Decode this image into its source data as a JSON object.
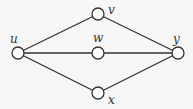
{
  "diagram": {
    "type": "graph",
    "colors": {
      "stroke": "#333333",
      "node_fill": "#ffffff",
      "background": "#f7f7f7"
    },
    "node_radius": 6,
    "nodes": [
      {
        "id": "u",
        "label": "u",
        "x": 18,
        "y": 53,
        "label_x": 10,
        "label_y": 43
      },
      {
        "id": "v",
        "label": "v",
        "x": 98,
        "y": 14,
        "label_x": 108,
        "label_y": 14
      },
      {
        "id": "w",
        "label": "w",
        "x": 98,
        "y": 53,
        "label_x": 93,
        "label_y": 42
      },
      {
        "id": "x",
        "label": "x",
        "x": 98,
        "y": 93,
        "label_x": 108,
        "label_y": 104
      },
      {
        "id": "y",
        "label": "y",
        "x": 178,
        "y": 53,
        "label_x": 173,
        "label_y": 43
      }
    ],
    "edges": [
      {
        "from": "u",
        "to": "v"
      },
      {
        "from": "u",
        "to": "w"
      },
      {
        "from": "u",
        "to": "x"
      },
      {
        "from": "v",
        "to": "y"
      },
      {
        "from": "w",
        "to": "y"
      },
      {
        "from": "x",
        "to": "y"
      }
    ]
  }
}
